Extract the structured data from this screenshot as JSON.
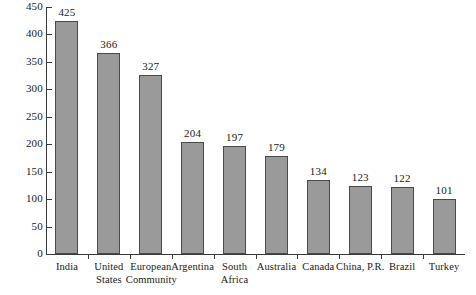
{
  "chart_data": {
    "type": "bar",
    "title": "",
    "subtitle": "",
    "xlabel": "",
    "ylabel": "",
    "ylim": [
      0,
      450
    ],
    "ytick_step": 50,
    "yticks": [
      0,
      50,
      100,
      150,
      200,
      250,
      300,
      350,
      400,
      450
    ],
    "ytick_labels": [
      "0",
      "50",
      "100",
      "150",
      "200",
      "250",
      "300",
      "350",
      "400",
      "450"
    ],
    "grid": false,
    "legend": false,
    "legend_position": "none",
    "value_labels": true,
    "categories": [
      "India",
      "United States",
      "European Community",
      "Argentina",
      "South Africa",
      "Australia",
      "Canada",
      "China, P.R.",
      "Brazil",
      "Turkey"
    ],
    "category_label_lines": [
      "India",
      "United\nStates",
      "European\nCommunity",
      "Argentina",
      "South\nAfrica",
      "Australia",
      "Canada",
      "China, P.R.",
      "Brazil",
      "Turkey"
    ],
    "values": [
      425,
      366,
      327,
      204,
      197,
      179,
      134,
      123,
      122,
      101
    ],
    "value_labels_text": [
      "425",
      "366",
      "327",
      "204",
      "197",
      "179",
      "134",
      "123",
      "122",
      "101"
    ],
    "colors": {
      "bar_fill": "#9a9a9a",
      "bar_border": "#4a4a4a",
      "axis": "#3a3a3a",
      "text": "#1a1a1a",
      "background": "#ffffff"
    }
  }
}
